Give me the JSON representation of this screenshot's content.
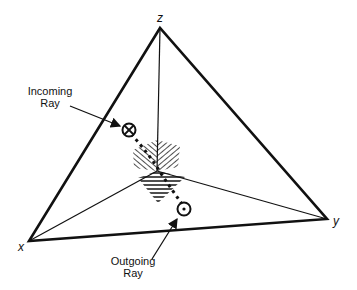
{
  "diagram": {
    "vertices": {
      "z": {
        "label": "z"
      },
      "x": {
        "label": "x"
      },
      "y": {
        "label": "y"
      }
    },
    "annotations": {
      "incoming": {
        "line1": "Incoming",
        "line2": "Ray",
        "symbol": "cross-circle (into page)"
      },
      "outgoing": {
        "line1": "Outgoing",
        "line2": "Ray",
        "symbol": "dot-circle (out of page)"
      }
    },
    "colors": {
      "stroke": "#111111",
      "background": "#ffffff"
    }
  }
}
